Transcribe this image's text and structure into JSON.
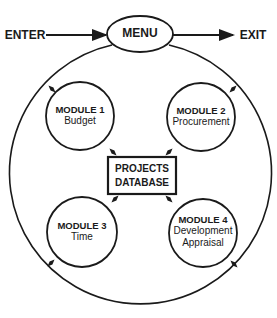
{
  "diagram": {
    "caption_fragment": "FIGURE",
    "entry": {
      "label": "ENTER"
    },
    "exit": {
      "label": "EXIT"
    },
    "menu": {
      "label": "MENU"
    },
    "database": {
      "line1": "PROJECTS",
      "line2": "DATABASE"
    },
    "modules": [
      {
        "title": "MODULE 1",
        "name": "Budget"
      },
      {
        "title": "MODULE 2",
        "name": "Procurement"
      },
      {
        "title": "MODULE 3",
        "name": "Time"
      },
      {
        "title": "MODULE 4",
        "name_line1": "Development",
        "name_line2": "Appraisal"
      }
    ],
    "colors": {
      "stroke": "#1a1a1a",
      "background": "#ffffff"
    }
  }
}
